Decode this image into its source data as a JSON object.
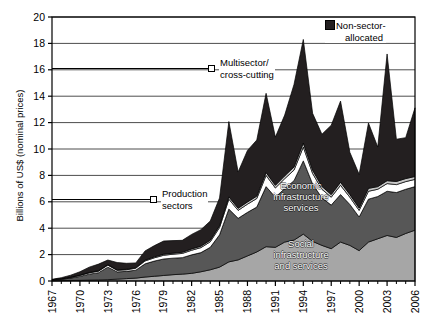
{
  "chart_data": {
    "type": "area",
    "title": "",
    "xlabel": "",
    "ylabel": "Billions of US$ (nominal prices)",
    "ylim": [
      0,
      20
    ],
    "yticks": [
      0,
      2,
      4,
      6,
      8,
      10,
      12,
      14,
      16,
      18,
      20
    ],
    "grid": true,
    "legend_position": "inside",
    "stacked": true,
    "x": [
      1967,
      1968,
      1969,
      1970,
      1971,
      1972,
      1973,
      1974,
      1975,
      1976,
      1977,
      1978,
      1979,
      1980,
      1981,
      1982,
      1983,
      1984,
      1985,
      1986,
      1987,
      1988,
      1989,
      1990,
      1991,
      1992,
      1993,
      1994,
      1995,
      1996,
      1997,
      1998,
      1999,
      2000,
      2001,
      2002,
      2003,
      2004,
      2005,
      2006
    ],
    "xtick_labels": [
      "1967",
      "1970",
      "1973",
      "1976",
      "1979",
      "1982",
      "1985",
      "1988",
      "1991",
      "1994",
      "1997",
      "2000",
      "2003",
      "2006"
    ],
    "xtick_values": [
      1967,
      1970,
      1973,
      1976,
      1979,
      1982,
      1985,
      1988,
      1991,
      1994,
      1997,
      2000,
      2003,
      2006
    ],
    "series": [
      {
        "name": "Social infrastructure and services",
        "color": "#a6a6a6",
        "values": [
          0.02,
          0.03,
          0.04,
          0.05,
          0.07,
          0.08,
          0.1,
          0.14,
          0.18,
          0.22,
          0.3,
          0.36,
          0.42,
          0.48,
          0.52,
          0.58,
          0.7,
          0.85,
          1.05,
          1.45,
          1.6,
          1.9,
          2.2,
          2.6,
          2.55,
          2.95,
          3.1,
          3.55,
          3.0,
          2.7,
          2.45,
          2.95,
          2.7,
          2.3,
          2.95,
          3.2,
          3.45,
          3.3,
          3.6,
          3.85
        ]
      },
      {
        "name": "Economic infrastructure services",
        "color": "#575757",
        "values": [
          0.05,
          0.1,
          0.18,
          0.3,
          0.45,
          0.55,
          0.95,
          0.55,
          0.55,
          0.6,
          1.0,
          1.15,
          1.25,
          1.25,
          1.25,
          1.4,
          1.45,
          1.7,
          2.45,
          4.0,
          3.15,
          3.3,
          3.4,
          4.55,
          3.8,
          4.05,
          4.5,
          5.55,
          4.35,
          3.6,
          3.3,
          3.6,
          3.1,
          2.55,
          3.25,
          3.2,
          3.35,
          3.4,
          3.35,
          3.3
        ]
      },
      {
        "name": "Production sectors",
        "color": "#ffffff",
        "values": [
          0.02,
          0.03,
          0.05,
          0.08,
          0.1,
          0.12,
          0.15,
          0.12,
          0.12,
          0.15,
          0.22,
          0.25,
          0.28,
          0.3,
          0.32,
          0.35,
          0.38,
          0.42,
          0.55,
          0.75,
          0.6,
          0.62,
          0.65,
          0.85,
          0.7,
          0.75,
          0.8,
          1.05,
          0.8,
          0.65,
          0.6,
          0.7,
          0.55,
          0.5,
          0.6,
          0.55,
          0.58,
          0.6,
          0.58,
          0.55
        ]
      },
      {
        "name": "Multisector/cross-cutting",
        "color": "#c8c8c8",
        "values": [
          0.01,
          0.01,
          0.02,
          0.02,
          0.03,
          0.03,
          0.04,
          0.04,
          0.04,
          0.05,
          0.06,
          0.07,
          0.08,
          0.08,
          0.09,
          0.1,
          0.11,
          0.12,
          0.14,
          0.18,
          0.16,
          0.17,
          0.18,
          0.22,
          0.2,
          0.22,
          0.24,
          0.3,
          0.25,
          0.22,
          0.2,
          0.23,
          0.2,
          0.18,
          0.22,
          0.2,
          0.22,
          0.24,
          0.23,
          0.22
        ]
      },
      {
        "name": "Non-sector-allocated",
        "color": "#231f20",
        "values": [
          0.03,
          0.08,
          0.15,
          0.25,
          0.4,
          0.5,
          0.35,
          0.55,
          0.45,
          0.35,
          0.7,
          0.85,
          1.0,
          0.95,
          0.9,
          1.1,
          1.25,
          1.45,
          2.1,
          5.7,
          2.75,
          3.9,
          4.25,
          6.0,
          3.65,
          4.6,
          6.25,
          7.85,
          4.3,
          3.95,
          5.25,
          6.15,
          3.2,
          2.55,
          4.95,
          3.0,
          9.6,
          3.2,
          3.1,
          5.2
        ]
      }
    ],
    "peaks": {
      "1994": 18.3,
      "2003": 17.2,
      "1986": 12.1
    }
  },
  "legend": {
    "non_sector": {
      "line1": "Non-sector-",
      "line2": "allocated",
      "swatch": "filled-black-square"
    }
  },
  "callouts": [
    {
      "id": "multisector",
      "line1": "Multisector/",
      "line2": "cross-cutting",
      "marker": "open-square"
    },
    {
      "id": "production",
      "line1": "Production",
      "line2": "sectors",
      "marker": "open-square"
    }
  ],
  "inline_labels": [
    {
      "id": "economic",
      "line1": "Economic",
      "line2": "infrastructure",
      "line3": "services"
    },
    {
      "id": "social",
      "line1": "Social",
      "line2": "infrastructure",
      "line3": "and services"
    }
  ],
  "axes": {
    "y_title": "Billions of US$ (nominal prices)"
  },
  "colors": {
    "social": "#a6a6a6",
    "economic": "#575757",
    "production": "#ffffff",
    "multisector": "#c8c8c8",
    "non_sector": "#231f20",
    "axis": "#000000",
    "grid": "#4d4d4d",
    "background": "#ffffff"
  }
}
